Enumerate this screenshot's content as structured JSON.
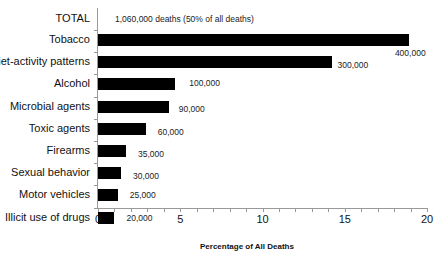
{
  "chart_data": {
    "type": "bar",
    "orientation": "horizontal",
    "title": "",
    "xlabel": "Percentage of All Deaths",
    "ylabel": "",
    "xlim": [
      0,
      20
    ],
    "x_ticks": [
      "0",
      "5",
      "10",
      "15",
      "20"
    ],
    "grid": false,
    "legend": null,
    "total_label": "TOTAL",
    "total_annotation": "1,060,000 deaths (50% of all deaths)",
    "categories": [
      "Tobacco",
      "Diet-activity patterns",
      "Alcohol",
      "Microbial agents",
      "Toxic agents",
      "Firearms",
      "Sexual behavior",
      "Motor vehicles",
      "Illicit use of drugs"
    ],
    "values": [
      18.9,
      14.2,
      4.7,
      4.3,
      2.9,
      1.7,
      1.4,
      1.2,
      1.0
    ],
    "annotations": [
      "400,000",
      "300,000",
      "100,000",
      "90,000",
      "60,000",
      "35,000",
      "30,000",
      "25,000",
      "20,000"
    ]
  }
}
